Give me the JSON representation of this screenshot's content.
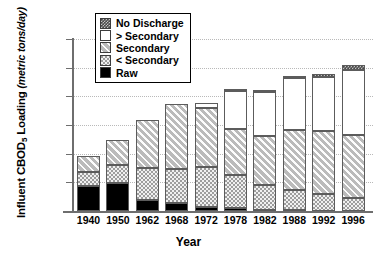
{
  "chart_data": {
    "type": "bar",
    "stacked": true,
    "title": "",
    "xlabel": "Year",
    "ylabel": "Influent CBOD5 Loading (metric tons/day)",
    "ylabel_main": "Influent CBOD",
    "ylabel_sub": "5",
    "ylabel_rest": " Loading ",
    "ylabel_units": "(metric tons/day)",
    "ylim": [
      0,
      30000
    ],
    "ytick_step": 5000,
    "ytick_labels": [
      "30,000",
      "25,000",
      "20,000",
      "15,000",
      "10,000",
      "5,000",
      "0"
    ],
    "ytick_values": [
      30000,
      25000,
      20000,
      15000,
      10000,
      5000,
      0
    ],
    "grid": true,
    "legend_position": "top-left",
    "categories": [
      "1940",
      "1950",
      "1962",
      "1968",
      "1972",
      "1978",
      "1982",
      "1988",
      "1992",
      "1996"
    ],
    "series": [
      {
        "name": "Raw",
        "key": "raw",
        "pattern": "solid-black",
        "color": "#000000",
        "values": [
          4300,
          4800,
          2000,
          1350,
          700,
          450,
          250,
          100,
          60,
          50
        ]
      },
      {
        "name": "< Secondary",
        "key": "lt_secondary",
        "pattern": "dotted-gray",
        "color": "#9d9d9d",
        "values": [
          2550,
          3200,
          5550,
          6000,
          6900,
          5800,
          4300,
          3650,
          2900,
          2250
        ]
      },
      {
        "name": "Secondary",
        "key": "secondary",
        "pattern": "light-diagonal",
        "color": "#d2d2d2",
        "values": [
          2750,
          4450,
          8300,
          11300,
          10300,
          8100,
          8500,
          10400,
          11050,
          10950
        ]
      },
      {
        "name": "> Secondary",
        "key": "gt_secondary",
        "pattern": "white",
        "color": "#ffffff",
        "values": [
          0,
          0,
          0,
          0,
          950,
          6600,
          7700,
          9000,
          9450,
          11400
        ]
      },
      {
        "name": "No Discharge",
        "key": "no_discharge",
        "pattern": "dark-checker",
        "color": "#4a4a4a",
        "values": [
          0,
          0,
          0,
          0,
          0,
          300,
          300,
          450,
          450,
          750
        ]
      }
    ],
    "totals": [
      9600,
      12450,
      15850,
      18650,
      18850,
      21250,
      21050,
      23600,
      23910,
      25400
    ]
  },
  "legend": {
    "items": [
      {
        "label": "No Discharge",
        "swatch": "dark-checker"
      },
      {
        "label": "> Secondary",
        "swatch": "white"
      },
      {
        "label": "Secondary",
        "swatch": "light-diagonal"
      },
      {
        "label": "< Secondary",
        "swatch": "dotted-gray"
      },
      {
        "label": "Raw",
        "swatch": "solid-black"
      }
    ]
  }
}
